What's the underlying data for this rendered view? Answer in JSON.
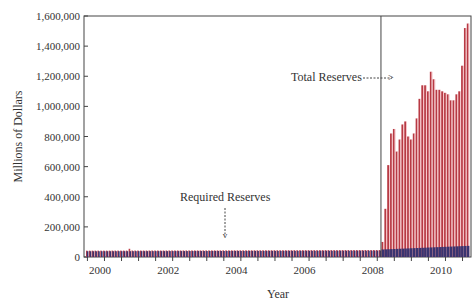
{
  "chart_data": {
    "type": "bar",
    "title": "",
    "xlabel": "Year",
    "ylabel": "Millions of Dollars",
    "ylim": [
      0,
      1600000
    ],
    "yticks": [
      "0",
      "200,000",
      "400,000",
      "600,000",
      "800,000",
      "1,000,000",
      "1,200,000",
      "1,400,000",
      "1,600,000"
    ],
    "xticks": [
      "2000",
      "2002",
      "2004",
      "2006",
      "2008",
      "2010"
    ],
    "grid": false,
    "annotations": [
      {
        "text": "Total Reserves",
        "arrow": "-------->"
      },
      {
        "text": "Required Reserves",
        "arrow": "down"
      }
    ],
    "series": [
      {
        "name": "Total Reserves",
        "color": "#c0404a",
        "note": "Approximately 40,000-45,000 monthly from 2000 to Aug 2008",
        "monthly_from": "2008-09",
        "values": [
          100000,
          320000,
          610000,
          820000,
          850000,
          700000,
          780000,
          880000,
          900000,
          800000,
          780000,
          820000,
          920000,
          1050000,
          1140000,
          1140000,
          1100000,
          1230000,
          1180000,
          1110000,
          1110000,
          1100000,
          1090000,
          1080000,
          1040000,
          1040000,
          1080000,
          1100000,
          1270000,
          1520000,
          1550000
        ]
      },
      {
        "name": "Required Reserves",
        "color": "#3a3470",
        "note": "Approximately 38,000-45,000 throughout 2000-2008, rising to ~70,000 by 2011"
      }
    ]
  },
  "labels": {
    "ylabel": "Millions of Dollars",
    "xlabel": "Year",
    "total": "Total Reserves",
    "total_arrow": "------->",
    "required": "Required Reserves"
  }
}
